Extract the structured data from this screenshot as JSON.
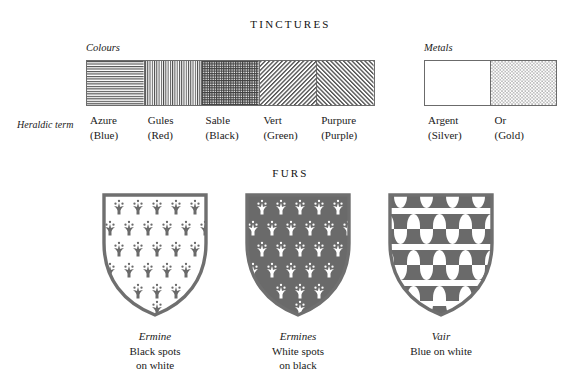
{
  "headings": {
    "tinctures": "TINCTURES",
    "furs": "FURS"
  },
  "labels": {
    "colours": "Colours",
    "metals": "Metals",
    "heraldic_term": "Heraldic term"
  },
  "colors": {
    "ink": "#1a1a1a",
    "hatch_line": "#4a4a4a",
    "swatch_border": "#6b6b6b",
    "shield_border": "#6f6f6f",
    "fur_dark": "#6a6a6a",
    "field_white": "#ffffff"
  },
  "colours": [
    {
      "term": "Azure",
      "gloss": "(Blue)",
      "hatching": "horizontal-lines",
      "icon": "hatch-horizontal-icon"
    },
    {
      "term": "Gules",
      "gloss": "(Red)",
      "hatching": "vertical-lines",
      "icon": "hatch-vertical-icon"
    },
    {
      "term": "Sable",
      "gloss": "(Black)",
      "hatching": "cross-hatch",
      "icon": "hatch-crosshatch-icon"
    },
    {
      "term": "Vert",
      "gloss": "(Green)",
      "hatching": "diagonal-bend",
      "icon": "hatch-diagonal-bend-icon"
    },
    {
      "term": "Purpure",
      "gloss": "(Purple)",
      "hatching": "diagonal-bend-sinister",
      "icon": "hatch-diagonal-sinister-icon"
    }
  ],
  "metals": [
    {
      "term": "Argent",
      "gloss": "(Silver)",
      "hatching": "plain-blank",
      "icon": "swatch-plain-icon"
    },
    {
      "term": "Or",
      "gloss": "(Gold)",
      "hatching": "dotted-stipple",
      "icon": "swatch-dotted-icon"
    }
  ],
  "furs": [
    {
      "name": "Ermine",
      "desc_line1": "Black spots",
      "desc_line2": "on white",
      "pattern": "ermine-spots-dark-on-white",
      "icon": "shield-ermine-icon"
    },
    {
      "name": "Ermines",
      "desc_line1": "White spots",
      "desc_line2": "on black",
      "pattern": "ermine-spots-white-on-dark",
      "icon": "shield-ermines-icon"
    },
    {
      "name": "Vair",
      "desc_line1": "Blue on white",
      "desc_line2": "",
      "pattern": "vair-bells",
      "icon": "shield-vair-icon"
    }
  ]
}
